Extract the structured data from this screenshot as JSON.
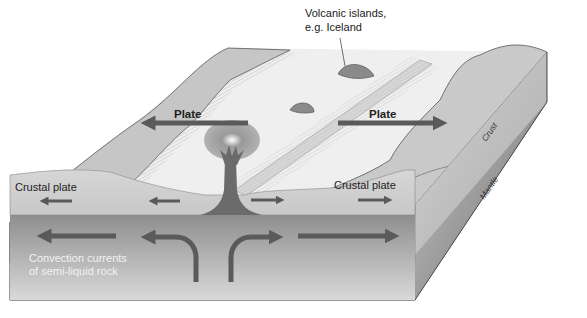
{
  "diagram": {
    "labels": {
      "volcanic_islands_line1": "Volcanic islands,",
      "volcanic_islands_line2": "e.g. Iceland",
      "plate_left": "Plate",
      "plate_right": "Plate",
      "crustal_plate_left": "Crustal plate",
      "crustal_plate_right": "Crustal plate",
      "convection_line1": "Convection currents",
      "convection_line2": "of semi-liquid rock",
      "crust_side": "Crust",
      "mantle_side": "Mantle"
    },
    "arrows": {
      "surface_plate_left": "left",
      "surface_plate_right": "right",
      "crust_left_outer": "left",
      "crust_left_inner": "left",
      "crust_right_inner": "right",
      "crust_right_outer": "right",
      "mantle_left_outer": "left",
      "mantle_left_curve": "up-then-left",
      "mantle_right_curve": "up-then-right",
      "mantle_right_outer": "right"
    },
    "colors": {
      "arrow": "#5a5a5a",
      "magma": "#6b6b6b",
      "crust_front": "#cfcfcf",
      "mantle_front": "#9a9a9a",
      "ocean_floor": "#efefef",
      "highland": "#c4c4c4"
    }
  }
}
